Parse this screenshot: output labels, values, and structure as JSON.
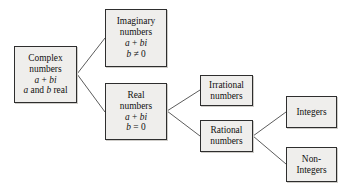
{
  "diagram": {
    "type": "tree",
    "colors": {
      "box_fill": "#efeeec",
      "box_border": "#2e2e2e",
      "box_shadow": "#cfcdc9",
      "connector": "#4a4a4a",
      "background": "#ffffff",
      "text": "#111111"
    },
    "nodes": [
      {
        "id": "complex",
        "lines": [
          "Complex",
          "numbers",
          "a + bi",
          "a and b real"
        ],
        "line1": "Complex",
        "line2": "numbers",
        "line3_a": "a",
        "line3_op": " + ",
        "line3_bi": "bi",
        "line4_a": "a",
        "line4_and": " and ",
        "line4_b": "b",
        "line4_real": " real"
      },
      {
        "id": "imaginary",
        "lines": [
          "Imaginary",
          "numbers",
          "a + bi",
          "b ≠ 0"
        ],
        "line1": "Imaginary",
        "line2": "numbers",
        "line3_a": "a",
        "line3_op": " + ",
        "line3_bi": "bi",
        "line4_b": "b",
        "line4_rest": " ≠ 0"
      },
      {
        "id": "real",
        "lines": [
          "Real",
          "numbers",
          "a + bi",
          "b = 0"
        ],
        "line1": "Real",
        "line2": "numbers",
        "line3_a": "a",
        "line3_op": " + ",
        "line3_bi": "bi",
        "line4_b": "b",
        "line4_rest": " = 0"
      },
      {
        "id": "irrational",
        "lines": [
          "Irrational",
          "numbers"
        ],
        "line1": "Irrational",
        "line2": "numbers"
      },
      {
        "id": "rational",
        "lines": [
          "Rational",
          "numbers"
        ],
        "line1": "Rational",
        "line2": "numbers"
      },
      {
        "id": "integers",
        "lines": [
          "Integers"
        ],
        "line1": "Integers"
      },
      {
        "id": "nonintegers",
        "lines": [
          "Non-",
          "Integers"
        ],
        "line1": "Non-",
        "line2": "Integers"
      }
    ],
    "edges": [
      {
        "from": "complex",
        "to": "imaginary"
      },
      {
        "from": "complex",
        "to": "real"
      },
      {
        "from": "real",
        "to": "irrational"
      },
      {
        "from": "real",
        "to": "rational"
      },
      {
        "from": "rational",
        "to": "integers"
      },
      {
        "from": "rational",
        "to": "nonintegers"
      }
    ]
  }
}
